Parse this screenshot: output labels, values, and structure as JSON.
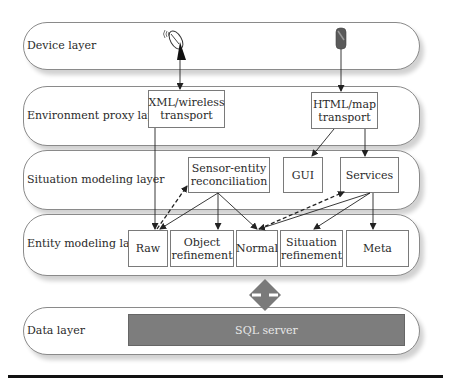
{
  "diagram": {
    "layers": [
      {
        "id": "device",
        "label": "Device layer"
      },
      {
        "id": "env",
        "label": "Environment proxy layer"
      },
      {
        "id": "situation",
        "label": "Situation modeling layer"
      },
      {
        "id": "entity",
        "label": "Entity modeling layer"
      },
      {
        "id": "data",
        "label": "Data layer"
      }
    ],
    "device_icons": [
      {
        "name": "satellite-dish-icon"
      },
      {
        "name": "mobile-phone-icon"
      }
    ],
    "env_boxes": [
      {
        "label_line1": "XML/wireless",
        "label_line2": "transport"
      },
      {
        "label_line1": "HTML/map",
        "label_line2": "transport"
      }
    ],
    "situation_boxes": [
      {
        "label_line1": "Sensor-entity",
        "label_line2": "reconciliation"
      },
      {
        "label_line1": "GUI",
        "label_line2": ""
      },
      {
        "label_line1": "Services",
        "label_line2": ""
      }
    ],
    "entity_boxes": [
      {
        "label_line1": "Raw",
        "label_line2": ""
      },
      {
        "label_line1": "Object",
        "label_line2": "refinement"
      },
      {
        "label_line1": "Normal",
        "label_line2": ""
      },
      {
        "label_line1": "Situation",
        "label_line2": "refinement"
      },
      {
        "label_line1": "Meta",
        "label_line2": ""
      }
    ],
    "data_store": {
      "label": "SQL server",
      "color": "#7d7d7d"
    },
    "connector": {
      "name": "bidirectional-diamond",
      "color": "#7a7a7a"
    },
    "edges": [
      {
        "from": "satellite-dish",
        "to": "XML/wireless transport",
        "style": "solid"
      },
      {
        "from": "mobile-phone",
        "to": "HTML/map transport",
        "style": "solid"
      },
      {
        "from": "XML/wireless transport",
        "to": "Raw",
        "style": "solid"
      },
      {
        "from": "HTML/map transport",
        "to": "GUI",
        "style": "solid"
      },
      {
        "from": "HTML/map transport",
        "to": "Services",
        "style": "solid"
      },
      {
        "from": "Raw",
        "to": "Sensor-entity reconciliation",
        "style": "dashed"
      },
      {
        "from": "Sensor-entity reconciliation",
        "to": "Raw",
        "style": "solid"
      },
      {
        "from": "Sensor-entity reconciliation",
        "to": "Object refinement",
        "style": "solid"
      },
      {
        "from": "Sensor-entity reconciliation",
        "to": "Normal",
        "style": "solid"
      },
      {
        "from": "Normal",
        "to": "Services",
        "style": "dashed"
      },
      {
        "from": "Services",
        "to": "Normal",
        "style": "solid"
      },
      {
        "from": "Services",
        "to": "Situation refinement",
        "style": "solid"
      },
      {
        "from": "Services",
        "to": "Meta",
        "style": "solid"
      }
    ]
  }
}
